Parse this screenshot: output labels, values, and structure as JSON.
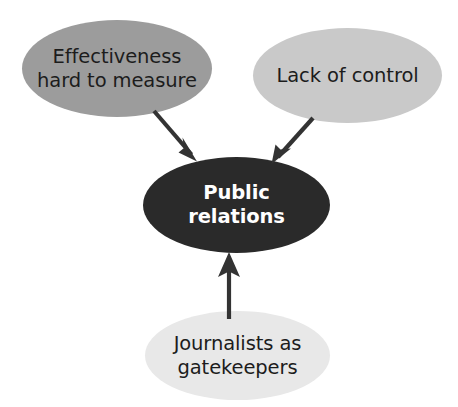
{
  "diagram": {
    "type": "convergence-diagram",
    "background_color": "#ffffff",
    "central_node": {
      "id": "public-relations",
      "label": "Public\nrelations",
      "fill_color": "#2a2a2a",
      "text_color": "#ffffff",
      "shape": "ellipse",
      "cx": 236.5,
      "cy": 205,
      "rx": 93.5,
      "ry": 48
    },
    "source_nodes": [
      {
        "id": "effectiveness-hard-to-measure",
        "label": "Effectiveness\nhard to measure",
        "fill_color": "#9c9c9c",
        "text_color": "#1c1c1c",
        "shape": "ellipse",
        "cx": 117,
        "cy": 68.5,
        "rx": 95,
        "ry": 48.5
      },
      {
        "id": "lack-of-control",
        "label": "Lack of control",
        "fill_color": "#c9c9c9",
        "text_color": "#1c1c1c",
        "shape": "ellipse",
        "cx": 347.5,
        "cy": 75.5,
        "rx": 94.5,
        "ry": 47.5
      },
      {
        "id": "journalists-as-gatekeepers",
        "label": "Journalists as\ngatekeepers",
        "fill_color": "#e8e8e8",
        "text_color": "#1c1c1c",
        "shape": "ellipse",
        "cx": 237.5,
        "cy": 355.5,
        "rx": 92.5,
        "ry": 44.5
      }
    ],
    "arrows": [
      {
        "id": "arrow-effectiveness-to-pr",
        "from": "effectiveness-hard-to-measure",
        "to": "public-relations",
        "color": "#333333",
        "direction": "down-right",
        "x1": 154,
        "y1": 111,
        "x2": 197,
        "y2": 161
      },
      {
        "id": "arrow-lack-of-control-to-pr",
        "from": "lack-of-control",
        "to": "public-relations",
        "color": "#333333",
        "direction": "down-left",
        "x1": 313,
        "y1": 118,
        "x2": 272,
        "y2": 163
      },
      {
        "id": "arrow-journalists-to-pr",
        "from": "journalists-as-gatekeepers",
        "to": "public-relations",
        "color": "#333333",
        "direction": "up",
        "x1": 229,
        "y1": 318,
        "x2": 229,
        "y2": 253
      }
    ]
  }
}
